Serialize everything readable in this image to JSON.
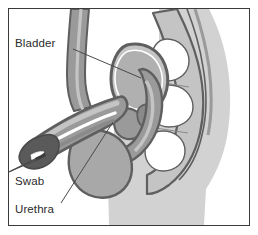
{
  "figure": {
    "type": "medical-illustration",
    "frame": {
      "border_color": "#3a3a3a",
      "background_color": "#ffffff"
    }
  },
  "palette": {
    "outline_dark": "#5f5f5f",
    "tissue_mid": "#9a9a9a",
    "tissue_light": "#c4c4c4",
    "body_silhouette": "#d2d2d2",
    "lumen_white": "#ffffff",
    "swab_dark": "#4a4a4a",
    "label_color": "#2b2b2b",
    "leader_line_color": "#4a4a4a"
  },
  "labels": [
    {
      "id": "bladder",
      "text": "Bladder",
      "x": 14,
      "y": 44,
      "leader": {
        "x1": 64,
        "y1": 40,
        "x2": 132,
        "y2": 69
      }
    },
    {
      "id": "swab",
      "text": "Swab",
      "x": 14,
      "y": 170,
      "leader": {
        "x1": 11,
        "y1": 158,
        "x2": 48,
        "y2": 146
      }
    },
    {
      "id": "urethra",
      "text": "Urethra",
      "x": 14,
      "y": 209,
      "leader": {
        "x1": 62,
        "y1": 198,
        "x2": 110,
        "y2": 121
      }
    }
  ],
  "anatomy_parts": [
    {
      "id": "body-silhouette",
      "name": "body silhouette"
    },
    {
      "id": "sacrum-spine",
      "name": "sacrum and vertebrae"
    },
    {
      "id": "bladder-organ",
      "name": "urinary bladder"
    },
    {
      "id": "prostate",
      "name": "prostate gland"
    },
    {
      "id": "rectum",
      "name": "rectum"
    },
    {
      "id": "penis-shaft",
      "name": "penis shaft"
    },
    {
      "id": "urethra-channel",
      "name": "urethral canal"
    },
    {
      "id": "glans",
      "name": "glans penis"
    },
    {
      "id": "scrotum",
      "name": "scrotum"
    },
    {
      "id": "abdominal-wall",
      "name": "abdominal wall"
    },
    {
      "id": "swab-instrument",
      "name": "swab instrument"
    }
  ]
}
